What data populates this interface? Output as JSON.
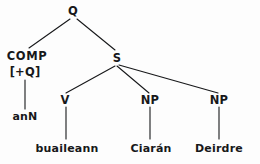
{
  "figure": {
    "kind": "syntax-tree",
    "ink_color": "#17181a",
    "background_color": "#fdfdfd"
  },
  "nodes": {
    "root": {
      "label": "Q",
      "x": 73,
      "y": 11
    },
    "comp": {
      "label": "COMP",
      "x": 27,
      "y": 56
    },
    "comp_feature": {
      "label": "[+Q]",
      "x": 25,
      "y": 72
    },
    "s": {
      "label": "S",
      "x": 117,
      "y": 58
    },
    "v": {
      "label": "V",
      "x": 65,
      "y": 100
    },
    "np1": {
      "label": "NP",
      "x": 150,
      "y": 100
    },
    "np2": {
      "label": "NP",
      "x": 219,
      "y": 100
    }
  },
  "terminals": {
    "comp_word": {
      "label": "anN",
      "x": 25,
      "y": 116
    },
    "v_word": {
      "label": "buaileann",
      "x": 67,
      "y": 148
    },
    "np1_word": {
      "label": "Ciarán",
      "x": 151,
      "y": 148
    },
    "np2_word": {
      "label": "Deirdre",
      "x": 219,
      "y": 148
    }
  },
  "edges": [
    {
      "name": "edge-q-comp",
      "x1": 70,
      "y1": 19,
      "x2": 29,
      "y2": 48
    },
    {
      "name": "edge-q-s",
      "x1": 77,
      "y1": 19,
      "x2": 115,
      "y2": 50
    },
    {
      "name": "edge-comp-ann",
      "x1": 25,
      "y1": 80,
      "x2": 25,
      "y2": 109
    },
    {
      "name": "edge-s-v",
      "x1": 115,
      "y1": 66,
      "x2": 66,
      "y2": 93
    },
    {
      "name": "edge-s-np1",
      "x1": 117,
      "y1": 66,
      "x2": 149,
      "y2": 93
    },
    {
      "name": "edge-s-np2",
      "x1": 119,
      "y1": 65,
      "x2": 218,
      "y2": 93
    },
    {
      "name": "edge-v-buaileann",
      "x1": 66,
      "y1": 107,
      "x2": 66,
      "y2": 139
    },
    {
      "name": "edge-np1-ciaran",
      "x1": 150,
      "y1": 107,
      "x2": 150,
      "y2": 139
    },
    {
      "name": "edge-np2-deirdre",
      "x1": 219,
      "y1": 107,
      "x2": 219,
      "y2": 139
    }
  ]
}
